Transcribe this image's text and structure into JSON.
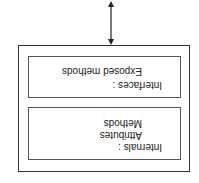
{
  "diagram": {
    "orientation": "rotated-180",
    "object_box": {
      "interfaces_panel": {
        "title": "Interfaces :",
        "items": [
          "Exposed methods"
        ]
      },
      "internals_panel": {
        "title": "Internals :",
        "items": [
          "Attributes",
          "Methods"
        ]
      }
    },
    "connector": "bidirectional-arrow"
  }
}
